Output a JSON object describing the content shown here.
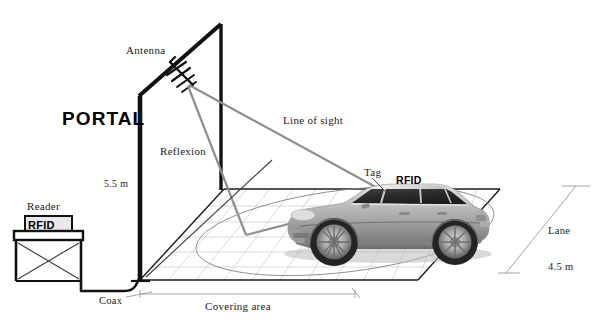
{
  "diagram": {
    "type": "technical-schematic",
    "background_color": "#ffffff",
    "ink_color": "#1b1b1b",
    "labels": {
      "portal": "PORTAL",
      "antenna": "Antenna",
      "reflexion": "Reflexion",
      "line_of_sight": "Line of sight",
      "tag": "Tag",
      "tag_rfid": "RFID",
      "reader": "Reader",
      "reader_rfid": "RFID",
      "portal_height": "5.5 m",
      "coax": "Coax",
      "covering_area": "Covering area",
      "lane_name": "Lane",
      "lane_width": "4.5 m"
    },
    "dimensions": {
      "portal_height_value": 5.5,
      "portal_height_unit": "m",
      "lane_width_value": 4.5,
      "lane_width_unit": "m"
    },
    "components": [
      {
        "name": "portal-frame",
        "description": "Vertical gantry frame supporting the antenna"
      },
      {
        "name": "yagi-antenna",
        "description": "RFID reader antenna mounted on portal top beam"
      },
      {
        "name": "rfid-reader-unit",
        "description": "RFID reader on a table stand"
      },
      {
        "name": "coax-cable",
        "description": "Coaxial cable linking reader to antenna"
      },
      {
        "name": "vehicle",
        "description": "Sedan car carrying a windshield RFID tag"
      },
      {
        "name": "coverage-ellipse",
        "description": "Antenna covering area footprint on the lane"
      },
      {
        "name": "ground-plane-grid",
        "description": "Gridded lane surface"
      }
    ],
    "rays": [
      {
        "name": "line-of-sight",
        "from": "antenna",
        "to": "tag"
      },
      {
        "name": "reflexion",
        "from": "antenna",
        "to": "ground",
        "then_to": "tag"
      }
    ]
  }
}
